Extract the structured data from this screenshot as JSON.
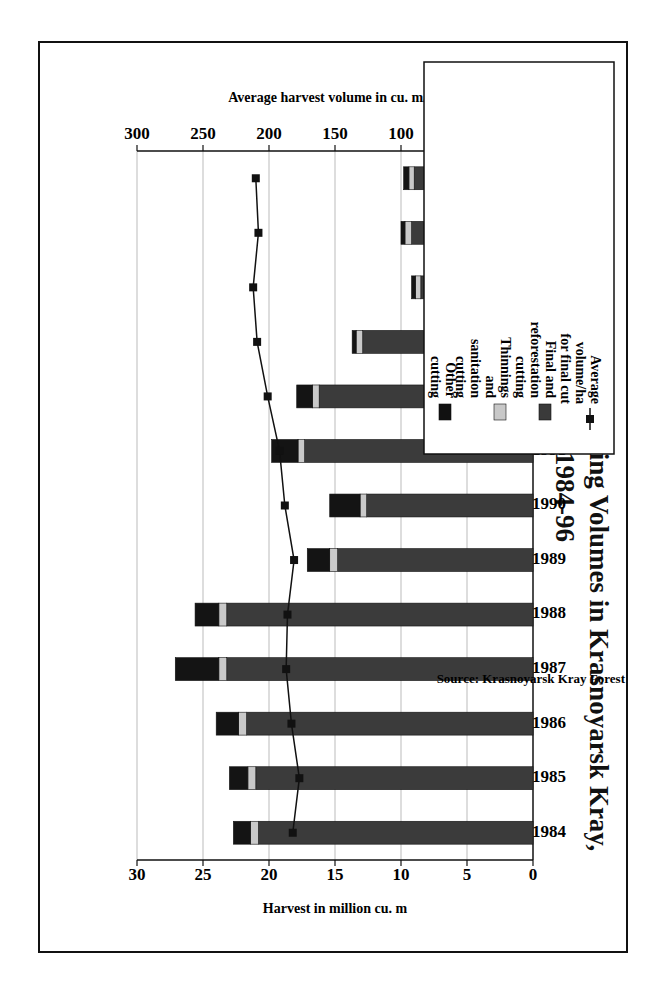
{
  "title_line1": "Figure A.7: Actual Harvesting Volumes in Krasnoyarsk Kray,",
  "title_line2": "1984-96",
  "source": "Source: Krasnoyarsk Kray Forest Committee, 1996.",
  "legend": [
    {
      "label": [
        "Other",
        "cutting"
      ],
      "color": "#111111"
    },
    {
      "label": [
        "Thinnings",
        "and",
        "sanitation",
        "cutting"
      ],
      "color": "#c8c8c8"
    },
    {
      "label": [
        "Final and",
        "reforestation",
        "cutting"
      ],
      "color": "#3a3a3a"
    },
    {
      "label": [
        "Average",
        "volume/ha",
        "for final cut"
      ],
      "color": "#111111"
    }
  ],
  "chart_data": {
    "type": "bar",
    "orientation": "stacked bar with line on secondary axis (figure rotated 90°)",
    "title": "Figure A.7: Actual Harvesting Volumes in Krasnoyarsk Kray, 1984-96",
    "categories": [
      "1984",
      "1985",
      "1986",
      "1987",
      "1988",
      "1989",
      "1990",
      "1991",
      "1992",
      "1993",
      "1994",
      "1995",
      "1996"
    ],
    "series": [
      {
        "name": "Final and reforestation cutting",
        "type": "bar",
        "axis": "left",
        "values": [
          20.8,
          21.0,
          21.7,
          23.2,
          23.2,
          14.8,
          12.6,
          17.3,
          16.2,
          12.9,
          8.5,
          9.2,
          9.0
        ]
      },
      {
        "name": "Thinnings and sanitation cutting",
        "type": "bar",
        "axis": "left",
        "values": [
          0.6,
          0.6,
          0.6,
          0.6,
          0.6,
          0.6,
          0.5,
          0.5,
          0.5,
          0.5,
          0.4,
          0.5,
          0.4
        ]
      },
      {
        "name": "Other cutting",
        "type": "bar",
        "axis": "left",
        "values": [
          1.3,
          1.4,
          1.7,
          3.3,
          1.8,
          1.7,
          2.3,
          2.0,
          1.2,
          0.3,
          0.3,
          0.3,
          0.4
        ]
      },
      {
        "name": "Average volume/ha for final cut",
        "type": "line",
        "axis": "right",
        "values": [
          182,
          177,
          183,
          187,
          186,
          181,
          188,
          192,
          201,
          209,
          212,
          208,
          210
        ]
      }
    ],
    "totals": [
      22.7,
      23.0,
      24.0,
      27.1,
      25.6,
      17.1,
      15.4,
      19.8,
      17.9,
      13.7,
      9.2,
      10.0,
      9.8
    ],
    "ylabel": "Harvest in million cu. m",
    "ylim": [
      0,
      30
    ],
    "yticks": [
      0,
      5,
      10,
      15,
      20,
      25,
      30
    ],
    "y2label": "Average harvest volume in cu. m/ha",
    "y2lim": [
      0,
      300
    ],
    "y2ticks": [
      0,
      50,
      100,
      150,
      200,
      250,
      300
    ],
    "grid": true,
    "legend_position": "right"
  }
}
